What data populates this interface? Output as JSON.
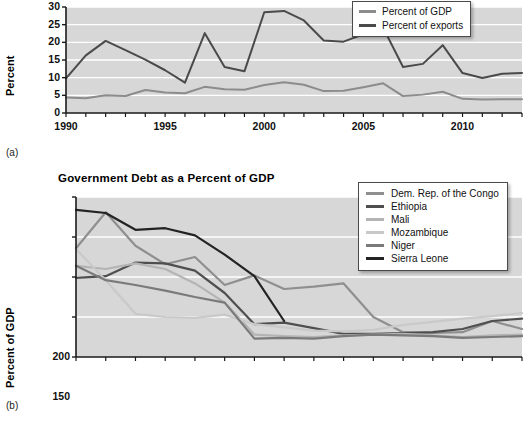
{
  "figure": {
    "panel_a_tag": "(a)",
    "panel_b_tag": "(b)"
  },
  "chart_data": [
    {
      "id": "panel_a",
      "type": "line",
      "title": "",
      "xlabel": "",
      "ylabel": "Percent",
      "xlim": [
        1990,
        2013
      ],
      "ylim": [
        0,
        30
      ],
      "yticks": [
        0,
        5,
        10,
        15,
        20,
        25,
        30
      ],
      "xticks": [
        1990,
        1995,
        2000,
        2005,
        2010
      ],
      "xtick_labels": [
        "1990",
        "1995",
        "2000",
        "2005",
        "2010"
      ],
      "ytick_labels": [
        "0",
        "5",
        "10",
        "15",
        "20",
        "25",
        "30"
      ],
      "grid": "horizontal-white",
      "legend_position": "top-right",
      "x": [
        1990,
        1991,
        1992,
        1993,
        1994,
        1995,
        1996,
        1997,
        1998,
        1999,
        2000,
        2001,
        2002,
        2003,
        2004,
        2005,
        2006,
        2007,
        2008,
        2009,
        2010,
        2011,
        2012,
        2013
      ],
      "series": [
        {
          "name": "Percent of GDP",
          "color": "#8c8c8c",
          "values": [
            4.4,
            4.2,
            5.0,
            4.8,
            6.5,
            5.8,
            5.6,
            7.4,
            6.7,
            6.6,
            7.9,
            8.7,
            8.0,
            6.2,
            6.3,
            7.3,
            8.4,
            4.8,
            5.2,
            6.0,
            4.0,
            3.8,
            3.9,
            3.9
          ]
        },
        {
          "name": "Percent of exports",
          "color": "#4a4a4a",
          "values": [
            9.8,
            16.3,
            20.4,
            17.8,
            15.1,
            12.1,
            8.6,
            22.6,
            13.0,
            11.8,
            28.5,
            28.9,
            26.2,
            20.5,
            20.2,
            22.3,
            24.1,
            13.0,
            13.9,
            19.2,
            11.3,
            9.9,
            11.1,
            11.3
          ]
        }
      ]
    },
    {
      "id": "panel_b",
      "type": "line",
      "title": "Government Debt as a Percent of GDP",
      "xlabel": "",
      "ylabel": "Percent of GDP",
      "ylim": [
        0,
        200
      ],
      "yticks": [
        0,
        50,
        100,
        150,
        200
      ],
      "ytick_labels": [
        "0",
        "50",
        "100",
        "150",
        "200"
      ],
      "xtick_labels": [
        "2000",
        "2002",
        "2004",
        "2006",
        "2008",
        "2010",
        "2013",
        "2014"
      ],
      "xtick_positions": [
        0,
        2,
        4,
        6,
        8,
        10,
        12,
        14
      ],
      "grid": "horizontal-white",
      "legend_position": "top-right",
      "x_index": [
        0,
        1,
        2,
        3,
        4,
        5,
        6,
        7,
        8,
        9,
        10,
        11,
        12,
        13,
        14,
        15
      ],
      "series": [
        {
          "name": "Dem. Rep. of the Congo",
          "color": "#8f8f8f",
          "values": [
            136,
            181,
            139,
            116,
            125,
            90,
            102,
            85,
            88,
            92,
            50,
            31,
            30,
            31,
            45,
            35
          ]
        },
        {
          "name": "Ethiopia",
          "color": "#4f4f4f",
          "values": [
            99,
            101,
            118,
            117,
            108,
            80,
            41,
            43,
            36,
            29,
            29,
            30,
            31,
            35,
            45,
            48
          ]
        },
        {
          "name": "Mali",
          "color": "#b4b4b4",
          "values": [
            114,
            110,
            117,
            110,
            92,
            68,
            28,
            26,
            25,
            27,
            28,
            29,
            27,
            25,
            27,
            28
          ]
        },
        {
          "name": "Mozambique",
          "color": "#c9c9c9",
          "values": [
            135,
            96,
            54,
            50,
            49,
            53,
            41,
            37,
            33,
            32,
            34,
            40,
            44,
            48,
            51,
            55
          ]
        },
        {
          "name": "Niger",
          "color": "#7a7a7a",
          "values": [
            114,
            96,
            90,
            83,
            75,
            68,
            23,
            24,
            23,
            26,
            28,
            27,
            26,
            24,
            25,
            26
          ]
        },
        {
          "name": "Sierra Leone",
          "color": "#232323",
          "values": [
            184,
            180,
            159,
            161,
            152,
            128,
            101,
            45,
            null,
            null,
            null,
            null,
            null,
            null,
            null,
            null
          ]
        }
      ]
    }
  ],
  "panel_a": {
    "ylabel": "Percent",
    "legend": {
      "items": [
        {
          "label": "Percent of GDP",
          "color": "#8c8c8c"
        },
        {
          "label": "Percent of exports",
          "color": "#4a4a4a"
        }
      ]
    },
    "yticks": [
      "30",
      "25",
      "20",
      "15",
      "10",
      "5",
      "0"
    ],
    "xticks": [
      "1990",
      "1995",
      "2000",
      "2005",
      "2010"
    ]
  },
  "panel_b": {
    "title": "Government Debt as a Percent of GDP",
    "ylabel": "Percent of GDP",
    "legend": {
      "items": [
        {
          "label": "Dem. Rep. of the Congo",
          "color": "#8f8f8f"
        },
        {
          "label": "Ethiopia",
          "color": "#4f4f4f"
        },
        {
          "label": "Mali",
          "color": "#b4b4b4"
        },
        {
          "label": "Mozambique",
          "color": "#c9c9c9"
        },
        {
          "label": "Niger",
          "color": "#7a7a7a"
        },
        {
          "label": "Sierra Leone",
          "color": "#232323"
        }
      ]
    },
    "yticks": [
      "200",
      "150",
      "100",
      "50",
      "0"
    ],
    "xticks": [
      "2000",
      "2002",
      "2004",
      "2006",
      "2008",
      "2010",
      "2013",
      "2014"
    ]
  },
  "colors": {
    "plot_background": "#d7d7d7",
    "gridline": "#ffffff",
    "axis": "#1a1a1a"
  }
}
